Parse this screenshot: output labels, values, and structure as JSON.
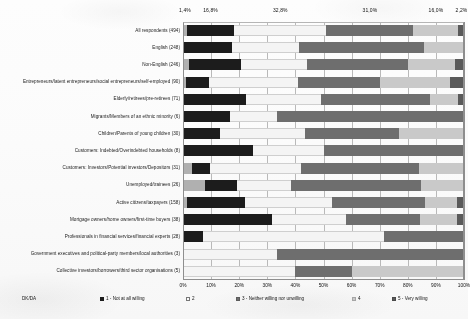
{
  "chart_data": {
    "type": "bar",
    "subtype": "100% stacked horizontal bar",
    "title": "",
    "xlabel": "",
    "ylabel": "",
    "xlim": [
      0,
      100
    ],
    "grid": true,
    "legend_position": "bottom",
    "xticks": [
      "0%",
      "10%",
      "20%",
      "30%",
      "40%",
      "50%",
      "60%",
      "70%",
      "80%",
      "90%",
      "100%"
    ],
    "top_value_labels": [
      "1,4%",
      "16,8%",
      "32,8%",
      "31,0%",
      "16,0%",
      "2,2%"
    ],
    "series": [
      {
        "name": "DK/DA",
        "key": "s0",
        "color": "#b0b0b0"
      },
      {
        "name": "1 - Not at all willing",
        "key": "s1",
        "color": "#1c1c1c"
      },
      {
        "name": "2",
        "key": "s2",
        "color": "#f4f4f4"
      },
      {
        "name": "3 - Neither willing nor unwilling",
        "key": "s3",
        "color": "#6e6e6e"
      },
      {
        "name": "4",
        "key": "s4",
        "color": "#c9c9c9"
      },
      {
        "name": "5 - Very willing",
        "key": "s5",
        "color": "#5a5a5a"
      }
    ],
    "categories": [
      "All respondents (494)",
      "English (248)",
      "Non-English (246)",
      "Entrepreneurs/latent entrepreneurs/social entrepreneurs/self-employed (90)",
      "Elderly/retirees/pre-retirees (71)",
      "Migrants/Members of an ethnic minority (6)",
      "Children/Parents of young children (30)",
      "Customers: Indebted/Overindebted households (8)",
      "Customers: Investors/Potential investors/Depositors (31)",
      "Unemployed/trainees (26)",
      "Active citizens/taxpayers (158)",
      "Mortgage owners/home owners/first-time buyers (38)",
      "Professionals in financial services/financial experts (28)",
      "Government executives and political-party members/local authorities (3)",
      "Collective investors/borrowers/third sector organisations (5)"
    ],
    "rows": [
      {
        "category": "All respondents (494)",
        "values": [
          1.4,
          16.8,
          32.8,
          31.0,
          16.0,
          2.2
        ]
      },
      {
        "category": "English (248)",
        "values": [
          0.0,
          17.3,
          24.0,
          44.4,
          14.3,
          0.0
        ]
      },
      {
        "category": "Non-English (246)",
        "values": [
          2.0,
          18.7,
          23.5,
          36.0,
          16.6,
          3.2
        ]
      },
      {
        "category": "Entrepreneurs/latent entrepreneurs/social entrepreneurs/self-employed (90)",
        "values": [
          1.1,
          8.0,
          32.0,
          29.0,
          24.9,
          5.0
        ]
      },
      {
        "category": "Elderly/retirees/pre-retirees (71)",
        "values": [
          0.0,
          22.5,
          26.5,
          39.0,
          10.0,
          2.0
        ]
      },
      {
        "category": "Migrants/Members of an ethnic minority (6)",
        "values": [
          0.0,
          16.7,
          16.6,
          66.7,
          0.0,
          0.0
        ]
      },
      {
        "category": "Children/Parents of young children (30)",
        "values": [
          0.0,
          13.3,
          30.0,
          33.4,
          23.3,
          0.0
        ]
      },
      {
        "category": "Customers: Indebted/Overindebted households (8)",
        "values": [
          0.0,
          25.0,
          25.0,
          50.0,
          0.0,
          0.0
        ]
      },
      {
        "category": "Customers: Investors/Potential investors/Depositors (31)",
        "values": [
          3.2,
          6.5,
          32.3,
          41.9,
          16.1,
          0.0
        ]
      },
      {
        "category": "Unemployed/trainees (26)",
        "values": [
          7.7,
          11.5,
          19.2,
          46.2,
          15.4,
          0.0
        ]
      },
      {
        "category": "Active citizens/taxpayers (158)",
        "values": [
          1.3,
          20.9,
          31.0,
          32.9,
          11.4,
          2.5
        ]
      },
      {
        "category": "Mortgage owners/home owners/first-time buyers (38)",
        "values": [
          0.0,
          31.6,
          26.3,
          26.3,
          13.2,
          2.6
        ]
      },
      {
        "category": "Professionals in financial services/financial experts (28)",
        "values": [
          0.0,
          7.1,
          64.3,
          28.6,
          0.0,
          0.0
        ]
      },
      {
        "category": "Government executives and political-party members/local authorities (3)",
        "values": [
          0.0,
          0.0,
          33.3,
          66.7,
          0.0,
          0.0
        ]
      },
      {
        "category": "Collective investors/borrowers/third sector organisations (5)",
        "values": [
          0.0,
          0.0,
          40.0,
          20.0,
          40.0,
          0.0
        ]
      }
    ]
  },
  "legend": {
    "items": [
      {
        "label": "DK/DA"
      },
      {
        "label": "1 - Not at all willing"
      },
      {
        "label": "2"
      },
      {
        "label": "3 - Neither willing nor unwilling"
      },
      {
        "label": "4"
      },
      {
        "label": "5 - Very willing"
      }
    ]
  }
}
